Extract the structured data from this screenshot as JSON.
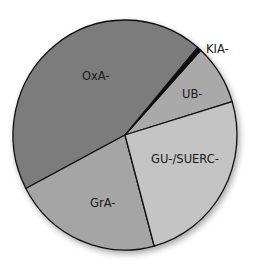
{
  "chart_data": {
    "type": "pie",
    "title": "",
    "slices": [
      {
        "label": "UB-",
        "value": 8.5,
        "color": "#a9a9a9"
      },
      {
        "label": "KIA-",
        "value": 0.6,
        "color": "#111111"
      },
      {
        "label": "OxA-",
        "value": 43.9,
        "color": "#7b7b7b"
      },
      {
        "label": "GrA-",
        "value": 21.5,
        "color": "#a5a5a5"
      },
      {
        "label": "GU-/SUERC-",
        "value": 25.5,
        "color": "#c4c4c4"
      }
    ],
    "start_angle_deg": 16.9,
    "direction": "counterclockwise",
    "legend": "none",
    "labels_position": "inside (KIA- outside)"
  },
  "labels": {
    "ub": "UB-",
    "kia": "KIA-",
    "oxa": "OxA-",
    "gra": "GrA-",
    "gu": "GU-/SUERC-"
  }
}
